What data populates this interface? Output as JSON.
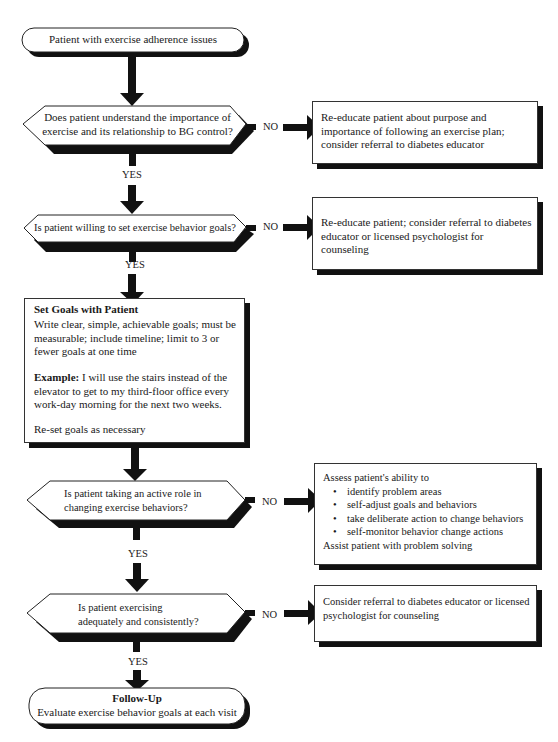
{
  "start": {
    "label": "Patient with exercise adherence issues"
  },
  "decisions": [
    {
      "question": "Does patient understand the importance of exercise and its relationship to BG control?",
      "line1": "Does patient understand the importance of",
      "line2": "exercise and its relationship to BG control?",
      "no_label": "NO",
      "yes_label": "YES",
      "no_action": "Re-educate patient about purpose and importance of following an exercise plan; consider referral to diabetes educator"
    },
    {
      "question": "Is patient willing to set exercise behavior goals?",
      "line1": "Is patient willing to set exercise behavior goals?",
      "no_label": "NO",
      "yes_label": "YES",
      "no_action": "Re-educate patient; consider referral to diabetes educator or licensed psychologist for counseling"
    },
    {
      "question": "Is patient taking an active role in changing exercise behaviors?",
      "line1": "Is patient taking an active role in",
      "line2": "changing exercise behaviors?",
      "no_label": "NO",
      "yes_label": "YES"
    },
    {
      "question": "Is patient exercising adequately and consistently?",
      "line1": "Is patient exercising",
      "line2": "adequately and consistently?",
      "no_label": "NO",
      "yes_label": "YES",
      "no_action": "Consider referral to diabetes educator or licensed psychologist for counseling"
    }
  ],
  "set_goals": {
    "title": "Set Goals with Patient",
    "body": "Write clear, simple, achievable goals; must be measurable; include timeline; limit to 3 or fewer goals at one time",
    "example_label": "Example:",
    "example_text": " I will use the stairs instead of the elevator to get to my third-floor office every work-day morning for the next two weeks.",
    "footer": "Re-set goals as necessary"
  },
  "assess_box": {
    "intro": "Assess patient's ability to",
    "bullets": [
      "identify problem areas",
      "self-adjust goals and behaviors",
      "take deliberate action to change behaviors",
      "self-monitor behavior change actions"
    ],
    "footer": "Assist patient with problem solving"
  },
  "end": {
    "title": "Follow-Up",
    "label": "Evaluate exercise behavior goals at each visit"
  },
  "colors": {
    "line": "#111111",
    "fill": "#ffffff",
    "text": "#1a1a1a"
  }
}
